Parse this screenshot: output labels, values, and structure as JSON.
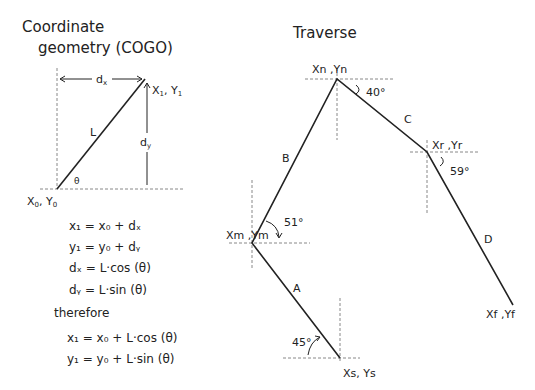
{
  "cogo": {
    "title_line1": "Coordinate",
    "title_line2": "geometry (COGO)",
    "labels": {
      "dx": "d",
      "dx_sub": "x",
      "dy": "d",
      "dy_sub": "y",
      "L": "L",
      "theta": "θ",
      "end_x": "X",
      "end_x_sub": "1",
      "end_sep": ", ",
      "end_y": "Y",
      "end_y_sub": "1",
      "start_x": "X",
      "start_x_sub": "0",
      "start_sep": ", ",
      "start_y": "Y",
      "start_y_sub": "0"
    },
    "equations": [
      "x₁ = x₀ + dₓ",
      "y₁ = y₀ + dᵧ",
      "dₓ = L·cos (θ)",
      "dᵧ = L·sin (θ)"
    ],
    "therefore": "therefore",
    "result_equations": [
      "x₁ = x₀ + L·cos (θ)",
      "y₁ = y₀ + L·sin (θ)"
    ]
  },
  "traverse": {
    "title": "Traverse",
    "points": {
      "n": "Xn ,Yn",
      "r": "Xr ,Yr",
      "m": "Xm ,Ym",
      "s": "Xs, Ys",
      "f": "Xf ,Yf"
    },
    "legs": {
      "A": "A",
      "B": "B",
      "C": "C",
      "D": "D"
    },
    "angles": {
      "at_n": "40°",
      "at_r": "59°",
      "at_m": "51°",
      "at_s": "45°"
    }
  }
}
